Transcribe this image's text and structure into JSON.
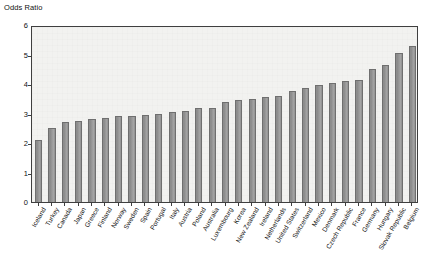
{
  "chart_data": {
    "type": "bar",
    "title": "",
    "ylabel": "Odds Ratio",
    "xlabel": "",
    "ylim": [
      0,
      6
    ],
    "ytick_labels": [
      "0",
      "1",
      "2",
      "3",
      "4",
      "5",
      "6"
    ],
    "yticks": [
      0,
      1,
      2,
      3,
      4,
      5,
      6
    ],
    "grid": false,
    "legend": "none",
    "categories": [
      "Iceland",
      "Turkey",
      "Canada",
      "Japan",
      "Greece",
      "Finland",
      "Norway",
      "Sweden",
      "Spain",
      "Portugal",
      "Italy",
      "Austria",
      "Poland",
      "Australia",
      "Luxembourg",
      "Korea",
      "New Zealand",
      "Ireland",
      "Netherlands",
      "United States",
      "Switzerland",
      "Mexico",
      "Denmark",
      "Czech Republic",
      "France",
      "Germany",
      "Hungary",
      "Slovak Republic",
      "Belgium"
    ],
    "values": [
      2.1,
      2.5,
      2.7,
      2.75,
      2.8,
      2.85,
      2.9,
      2.9,
      2.95,
      3.0,
      3.05,
      3.1,
      3.2,
      3.2,
      3.4,
      3.45,
      3.5,
      3.55,
      3.6,
      3.75,
      3.85,
      3.95,
      4.05,
      4.1,
      4.15,
      4.5,
      4.65,
      5.05,
      5.3
    ]
  },
  "axis_title": "Odds Ratio",
  "colors": {
    "bar_fill": "#9b9b9b",
    "bar_edge": "#6f6f6f",
    "plot_background": "#f2f2f0",
    "frame": "#3f3f3f",
    "text": "#111111"
  }
}
